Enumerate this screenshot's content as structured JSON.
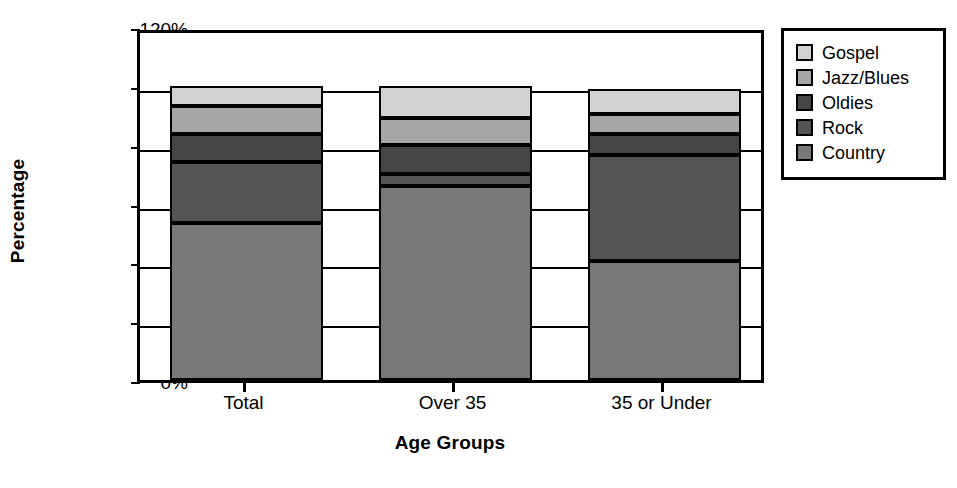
{
  "chart_data": {
    "type": "bar",
    "stacked": true,
    "title": "",
    "xlabel": "Age Groups",
    "ylabel": "Percentage",
    "categories": [
      "Total",
      "Over 35",
      "35 or Under"
    ],
    "ylim": [
      0,
      120
    ],
    "ytick_labels": [
      "0%",
      "20%",
      "40%",
      "60%",
      "80%",
      "100%",
      "120%"
    ],
    "ytick_values": [
      0,
      20,
      40,
      60,
      80,
      100,
      120
    ],
    "minor_ticks": [
      10,
      30,
      50,
      70,
      90,
      110
    ],
    "grid": true,
    "legend_position": "right-outside",
    "series": [
      {
        "name": "Country",
        "color": "#787878",
        "values": [
          53.5,
          66.0,
          40.5
        ]
      },
      {
        "name": "Rock",
        "color": "#555555",
        "values": [
          20.5,
          4.0,
          36.0
        ]
      },
      {
        "name": "Oldies",
        "color": "#454545",
        "values": [
          9.5,
          10.0,
          7.0
        ]
      },
      {
        "name": "Jazz/Blues",
        "color": "#a6a6a6",
        "values": [
          9.5,
          9.0,
          7.0
        ]
      },
      {
        "name": "Gospel",
        "color": "#d2d2d2",
        "values": [
          7.0,
          11.0,
          8.5
        ]
      }
    ],
    "legend_order": [
      "Gospel",
      "Jazz/Blues",
      "Oldies",
      "Rock",
      "Country"
    ],
    "totals": [
      100.0,
      100.0,
      99.0
    ]
  },
  "axis": {
    "y_title": "Percentage",
    "x_title": "Age Groups"
  }
}
